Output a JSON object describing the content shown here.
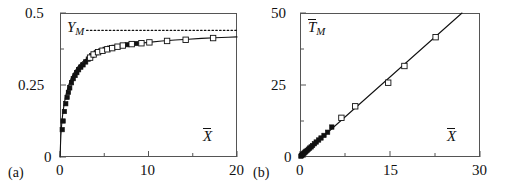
{
  "figure": {
    "background": "#ffffff",
    "axis_color": "#555555",
    "ink_color": "#111111",
    "panels": [
      {
        "tag": "(a)",
        "id": "panel-a",
        "frame": {
          "x": 60,
          "y": 13,
          "w": 177,
          "h": 144
        },
        "y_axis": {
          "label": "Y",
          "label_sub": "M",
          "label_overbar": false,
          "min": 0,
          "max": 0.5,
          "major_ticks": [
            0,
            0.25,
            0.5
          ],
          "major_tick_labels": [
            "0",
            "0.25",
            "0.5"
          ],
          "minor_ticks": [
            0.125,
            0.375
          ]
        },
        "x_axis": {
          "label": "X",
          "label_overbar": true,
          "min": 0,
          "max": 20,
          "major_ticks": [
            0,
            10,
            20
          ],
          "major_tick_labels": [
            "0",
            "10",
            "20"
          ],
          "minor_ticks": [
            5,
            15
          ]
        },
        "asymptote": {
          "value": 0.44,
          "style": "dotted"
        }
      },
      {
        "tag": "(b)",
        "id": "panel-b",
        "frame": {
          "x": 300,
          "y": 13,
          "w": 180,
          "h": 144
        },
        "y_axis": {
          "label": "T",
          "label_sub": "M",
          "label_overbar": true,
          "min": 0,
          "max": 50,
          "major_ticks": [
            0,
            25,
            50
          ],
          "major_tick_labels": [
            "0",
            "25",
            "50"
          ],
          "minor_ticks": [
            12.5,
            37.5
          ]
        },
        "x_axis": {
          "label": "X",
          "label_overbar": true,
          "min": 0,
          "max": 30,
          "major_ticks": [
            0,
            15,
            30
          ],
          "major_tick_labels": [
            "0",
            "15",
            "30"
          ],
          "minor_ticks": [
            7.5,
            22.5
          ]
        }
      }
    ]
  },
  "chart_data": [
    {
      "type": "scatter",
      "panel": "(a)",
      "title": "",
      "xlabel": "X̄",
      "ylabel": "Y_M",
      "xlim": [
        0,
        20
      ],
      "ylim": [
        0,
        0.5
      ],
      "grid": false,
      "legend": "none",
      "annotations": [
        {
          "text": "Y_M",
          "x": 1.2,
          "y": 0.455
        },
        {
          "text": "X̄",
          "x": 17.0,
          "y": 0.085
        }
      ],
      "series": [
        {
          "name": "model curve",
          "type": "line",
          "style": "solid",
          "color": "#111111",
          "x": [
            0.0,
            0.1,
            0.2,
            0.3,
            0.45,
            0.6,
            0.8,
            1.0,
            1.3,
            1.6,
            2.0,
            2.4,
            2.8,
            3.2,
            3.6,
            4.0,
            4.6,
            5.2,
            6.0,
            7.0,
            8.0,
            9.0,
            10.0,
            11.5,
            13.0,
            14.5,
            16.0,
            17.5,
            19.0,
            20.0
          ],
          "y": [
            0.0,
            0.075,
            0.118,
            0.147,
            0.18,
            0.205,
            0.231,
            0.251,
            0.275,
            0.293,
            0.312,
            0.326,
            0.337,
            0.345,
            0.352,
            0.358,
            0.366,
            0.372,
            0.379,
            0.386,
            0.391,
            0.395,
            0.398,
            0.403,
            0.406,
            0.409,
            0.412,
            0.414,
            0.416,
            0.417
          ]
        },
        {
          "name": "asymptote Y_M∞",
          "type": "line",
          "style": "dotted",
          "color": "#111111",
          "x": [
            3.0,
            20.0
          ],
          "y": [
            0.44,
            0.44
          ]
        },
        {
          "name": "filled squares",
          "type": "scatter",
          "marker": "filled-square",
          "color": "#111111",
          "x": [
            0.25,
            0.35,
            0.5,
            0.65,
            0.8,
            0.95,
            1.1,
            1.3,
            1.5,
            1.7,
            1.9,
            2.1,
            2.35,
            2.6,
            2.9,
            3.2,
            3.6,
            4.1,
            4.6,
            5.1,
            5.6,
            6.1,
            7.6,
            8.6
          ],
          "y": [
            0.095,
            0.125,
            0.158,
            0.185,
            0.207,
            0.224,
            0.24,
            0.258,
            0.272,
            0.283,
            0.293,
            0.303,
            0.312,
            0.32,
            0.33,
            0.34,
            0.352,
            0.362,
            0.368,
            0.374,
            0.378,
            0.381,
            0.39,
            0.394
          ]
        },
        {
          "name": "open squares",
          "type": "scatter",
          "marker": "open-square",
          "color": "#111111",
          "x": [
            3.4,
            3.8,
            4.3,
            4.8,
            5.35,
            5.9,
            6.5,
            7.1,
            8.1,
            9.2,
            10.1,
            12.1,
            14.2,
            17.3
          ],
          "y": [
            0.345,
            0.356,
            0.364,
            0.369,
            0.374,
            0.378,
            0.383,
            0.387,
            0.392,
            0.395,
            0.398,
            0.403,
            0.407,
            0.413
          ]
        }
      ]
    },
    {
      "type": "scatter",
      "panel": "(b)",
      "title": "",
      "xlabel": "X̄",
      "ylabel": "T̄_M",
      "xlim": [
        0,
        30
      ],
      "ylim": [
        0,
        50
      ],
      "grid": false,
      "legend": "none",
      "annotations": [
        {
          "text": "T̄_M",
          "x": 1.6,
          "y": 46.0
        },
        {
          "text": "X̄",
          "x": 25.5,
          "y": 8.5
        }
      ],
      "series": [
        {
          "name": "fit line",
          "type": "line",
          "style": "solid",
          "color": "#111111",
          "x": [
            0.0,
            27.0
          ],
          "y": [
            0.0,
            50.0
          ]
        },
        {
          "name": "filled squares",
          "type": "scatter",
          "marker": "filled-square",
          "color": "#111111",
          "x": [
            0.15,
            0.25,
            0.35,
            0.45,
            0.55,
            0.7,
            0.85,
            1.0,
            1.2,
            1.4,
            1.6,
            1.85,
            2.1,
            2.4,
            2.7,
            3.1,
            3.5,
            4.0,
            4.6,
            5.3
          ],
          "y": [
            0.3,
            0.5,
            0.7,
            0.9,
            1.1,
            1.4,
            1.7,
            2.0,
            2.3,
            2.7,
            3.1,
            3.5,
            4.0,
            4.6,
            5.2,
            5.9,
            6.6,
            7.5,
            8.6,
            10.4
          ]
        },
        {
          "name": "open squares",
          "type": "scatter",
          "marker": "open-square",
          "color": "#111111",
          "x": [
            6.9,
            9.2,
            14.7,
            17.4,
            22.6
          ],
          "y": [
            13.6,
            17.6,
            25.8,
            31.6,
            41.6
          ]
        }
      ]
    }
  ]
}
